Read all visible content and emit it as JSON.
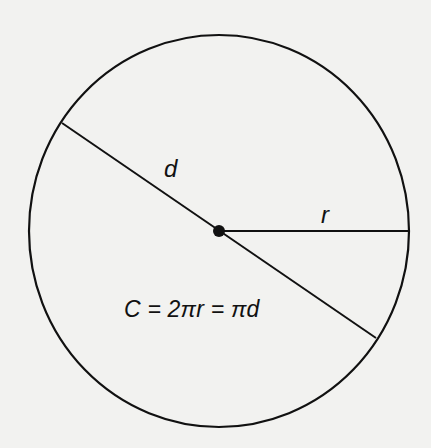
{
  "diagram": {
    "labels": {
      "diameter": "d",
      "radius": "r",
      "formula": "C = 2πr = πd"
    },
    "colors": {
      "background": "#f2f2f0",
      "stroke": "#111111"
    },
    "geometry": {
      "center": [
        219,
        231
      ],
      "radius_x": 190,
      "radius_y": 196,
      "diameter_endpoints": [
        [
          62,
          123
        ],
        [
          376,
          338
        ]
      ],
      "radius_endpoint": [
        409,
        231
      ]
    }
  }
}
